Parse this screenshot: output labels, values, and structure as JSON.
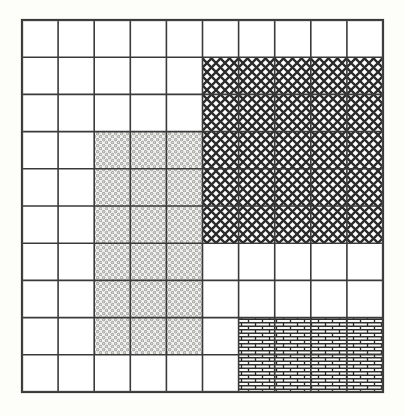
{
  "diagram": {
    "canvas": {
      "width": 405,
      "height": 416,
      "background": "#fdfdfa"
    },
    "grid": {
      "name": "10x10-grid",
      "origin_x": 22,
      "origin_y": 20,
      "cols": 10,
      "rows": 10,
      "cell_width": 36.1,
      "cell_height": 37.2,
      "line_color": "#3a3a3a",
      "line_width": 1.6,
      "outer_line_width": 2.2,
      "cell_fill": "#ffffff"
    },
    "patterns": [
      {
        "id": "crosshatch",
        "label": "Diagonal crosshatch",
        "color": "#2b2b2b",
        "background": "#ffffff",
        "tile": 9,
        "stroke": 2.3
      },
      {
        "id": "stipple",
        "label": "Circle stipple",
        "color": "#8a8a8a",
        "background": "#f2f2ef",
        "tile": 6,
        "stroke": 0.9
      },
      {
        "id": "brick",
        "label": "Running-bond brick",
        "color": "#2b2b2b",
        "background": "#fbfbf8",
        "tile_width": 14,
        "tile_height": 7,
        "stroke": 1.4
      }
    ],
    "regions": [
      {
        "name": "region-crosshatch",
        "pattern": "crosshatch",
        "col_start": 5,
        "col_end": 10,
        "row_start": 1,
        "row_end": 6,
        "cols": 5,
        "rows": 5,
        "cells": 25
      },
      {
        "name": "region-stipple",
        "pattern": "stipple",
        "col_start": 2,
        "col_end": 5,
        "row_start": 3,
        "row_end": 9,
        "cols": 3,
        "rows": 6,
        "cells": 18
      },
      {
        "name": "region-brick",
        "pattern": "brick",
        "col_start": 6,
        "col_end": 10,
        "row_start": 8,
        "row_end": 10,
        "cols": 4,
        "rows": 2,
        "cells": 8
      },
      {
        "name": "region-blank",
        "pattern": "none",
        "label": "Unhatched cells",
        "cells": 49
      }
    ]
  }
}
